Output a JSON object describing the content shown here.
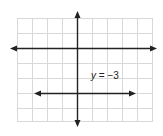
{
  "diagram": {
    "type": "coordinate-plane",
    "grid": {
      "columns": 9,
      "rows": 7,
      "line_color": "#d8d8d8",
      "cell_px": 15
    },
    "axes": {
      "color": "#222222",
      "x_axis_arrows": "both",
      "y_axis_arrows": "both"
    },
    "lines": [
      {
        "equation_var": "y",
        "equation_rest": " = −3",
        "value": -3,
        "orientation": "horizontal",
        "arrows": "both"
      }
    ]
  }
}
